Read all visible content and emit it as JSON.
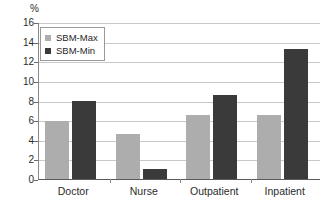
{
  "chart_data": {
    "type": "bar",
    "title": "",
    "subtitle": "",
    "xlabel": "",
    "ylabel": "%",
    "unit_label": "%",
    "categories": [
      "Doctor",
      "Nurse",
      "Outpatient",
      "Inpatient"
    ],
    "series": [
      {
        "name": "SBM-Max",
        "color": "#adadad",
        "values": [
          5.9,
          4.6,
          6.5,
          6.5
        ]
      },
      {
        "name": "SBM-Min",
        "color": "#3a3a3a",
        "values": [
          8.0,
          1.0,
          8.6,
          13.3
        ]
      }
    ],
    "ylim": [
      0,
      16
    ],
    "ytick_step": 2,
    "yticks": [
      "16",
      "14",
      "12",
      "10",
      "8",
      "6",
      "4",
      "2",
      "0"
    ],
    "ytick_values": [
      16,
      14,
      12,
      10,
      8,
      6,
      4,
      2,
      0
    ],
    "grid": true,
    "grid_axis": "y",
    "legend_position": "top-left",
    "legend": [
      "SBM-Max",
      "SBM-Min"
    ]
  },
  "colors": {
    "series_max": "#adadad",
    "series_min": "#3a3a3a",
    "gridline": "#c8c8c8",
    "axis": "#5a5a5a",
    "text": "#2b2b2b",
    "background": "#ffffff"
  }
}
